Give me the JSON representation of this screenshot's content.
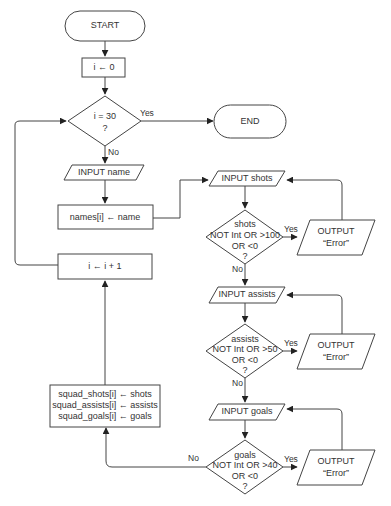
{
  "flowchart": {
    "start": "START",
    "init": "i ← 0",
    "loop_decision": [
      "i = 30",
      "?"
    ],
    "end": "END",
    "input_name": "INPUT name",
    "assign_name": "names[i] ← name",
    "increment": "i ← i + 1",
    "input_shots": "INPUT shots",
    "shots_decision": [
      "shots",
      "NOT Int OR >100",
      "OR <0",
      "?"
    ],
    "input_assists": "INPUT assists",
    "assists_decision": [
      "assists",
      "NOT Int OR >50",
      "OR <0",
      "?"
    ],
    "input_goals": "INPUT goals",
    "goals_decision": [
      "goals",
      "NOT Int OR >40",
      "OR <0",
      "?"
    ],
    "error_output": [
      "OUTPUT",
      "“Error”"
    ],
    "store": [
      "squad_shots[i] ← shots",
      "squad_assists[i] ← assists",
      "squad_goals[i] ← goals"
    ],
    "labels": {
      "yes": "Yes",
      "no": "No"
    }
  }
}
